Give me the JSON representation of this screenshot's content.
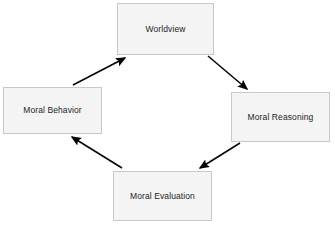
{
  "diagram": {
    "type": "cycle-diagram",
    "background_color": "#ffffff",
    "node_fill_color": "#f4f4f4",
    "node_border_color": "#c8c8c8",
    "arrow_color": "#000000",
    "label_color": "#1d1d1d",
    "nodes": [
      {
        "id": "worldview",
        "label": "Worldview",
        "position": "top"
      },
      {
        "id": "moral-reasoning",
        "label": "Moral Reasoning",
        "position": "right"
      },
      {
        "id": "moral-evaluation",
        "label": "Moral Evaluation",
        "position": "bottom"
      },
      {
        "id": "moral-behavior",
        "label": "Moral Behavior",
        "position": "left"
      }
    ],
    "edges": [
      {
        "id": "worldview-to-moral-reasoning",
        "from": "worldview",
        "to": "moral-reasoning",
        "direction": "down-right"
      },
      {
        "id": "moral-reasoning-to-moral-evaluation",
        "from": "moral-reasoning",
        "to": "moral-evaluation",
        "direction": "down-left"
      },
      {
        "id": "moral-evaluation-to-moral-behavior",
        "from": "moral-evaluation",
        "to": "moral-behavior",
        "direction": "up-left"
      },
      {
        "id": "moral-behavior-to-worldview",
        "from": "moral-behavior",
        "to": "worldview",
        "direction": "up-right"
      }
    ]
  }
}
